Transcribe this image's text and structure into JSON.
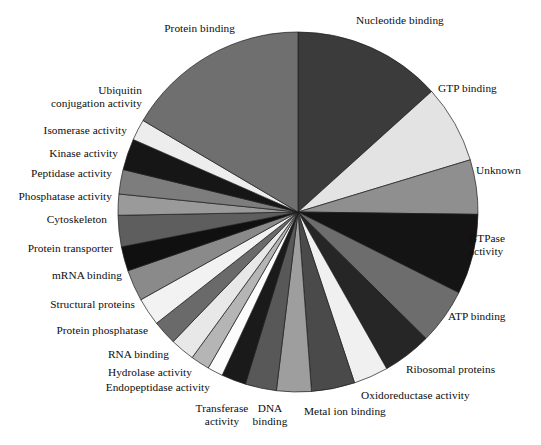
{
  "chart_data": {
    "type": "pie",
    "title": "",
    "subtitle": "",
    "xlabel": "",
    "ylabel": "",
    "legend_position": "none",
    "grid": false,
    "label_style": "outside-leader-free",
    "start_angle_deg": 0,
    "direction": "clockwise",
    "units": "percent of annotated proteins",
    "center": {
      "x": 298,
      "y": 212
    },
    "radius": 180,
    "categories": [
      "Nucleotide binding",
      "GTP binding",
      "Unknown",
      "GTPase activity",
      "ATP binding",
      "Ribosomal proteins",
      "Oxidoreductase activity",
      "Metal ion binding",
      "DNA binding",
      "Transferase activity",
      "Endopeptidase activity",
      "Hydrolase activity",
      "RNA binding",
      "Protein phosphatase",
      "Structural proteins",
      "mRNA binding",
      "Protein transporter",
      "Cytoskeleton",
      "Phosphatase activity",
      "Peptidase activity",
      "Kinase activity",
      "Isomerase activity",
      "Ubiquitin conjugation activity",
      "Protein binding"
    ],
    "values": [
      13.3,
      7.0,
      4.9,
      7.2,
      5.0,
      4.4,
      3.1,
      3.9,
      3.1,
      2.8,
      2.2,
      1.4,
      1.7,
      2.2,
      2.2,
      2.5,
      2.8,
      2.2,
      2.8,
      1.9,
      2.2,
      2.8,
      1.9,
      16.5
    ],
    "angles_deg": [
      47.9,
      25.2,
      17.6,
      25.9,
      18.0,
      15.8,
      11.2,
      14.0,
      11.2,
      10.1,
      7.9,
      5.0,
      6.1,
      7.9,
      7.9,
      9.0,
      10.1,
      7.9,
      10.1,
      6.8,
      7.9,
      10.1,
      6.8,
      59.4
    ],
    "colors": [
      "#3b3b3b",
      "#e3e3e3",
      "#8f8f8f",
      "#141414",
      "#6d6d6d",
      "#262626",
      "#f0f0f0",
      "#4a4a4a",
      "#9e9e9e",
      "#585858",
      "#1a1a1a",
      "#fcfcfc",
      "#b5b5b5",
      "#e8e8e8",
      "#6a6a6a",
      "#f2f2f2",
      "#8a8a8a",
      "#101010",
      "#5e5e5e",
      "#9a9a9a",
      "#7d7d7d",
      "#161616",
      "#ededed",
      "#6f6f6f"
    ]
  },
  "labels": [
    {
      "name": "label-nucleotide-binding",
      "text": "Nucleotide binding",
      "x": 356,
      "y": 14,
      "align": "left"
    },
    {
      "name": "label-gtp-binding",
      "text": "GTP binding",
      "x": 438,
      "y": 82,
      "align": "left"
    },
    {
      "name": "label-unknown",
      "text": "Unknown",
      "x": 476,
      "y": 164,
      "align": "left"
    },
    {
      "name": "label-gtpase-activity",
      "text": "GTPase\nactivity",
      "x": 469,
      "y": 232,
      "align": "left"
    },
    {
      "name": "label-atp-binding",
      "text": "ATP binding",
      "x": 448,
      "y": 310,
      "align": "left"
    },
    {
      "name": "label-ribosomal-proteins",
      "text": "Ribosomal proteins",
      "x": 406,
      "y": 363,
      "align": "left"
    },
    {
      "name": "label-oxidoreductase",
      "text": "Oxidoreductase activity",
      "x": 361,
      "y": 389,
      "align": "left"
    },
    {
      "name": "label-metal-ion-binding",
      "text": "Metal ion binding",
      "x": 304,
      "y": 405,
      "align": "left"
    },
    {
      "name": "label-dna-binding",
      "text": "DNA\nbinding",
      "x": 270,
      "y": 402,
      "align": "center"
    },
    {
      "name": "label-transferase",
      "text": "Transferase\nactivity",
      "x": 222,
      "y": 402,
      "align": "center"
    },
    {
      "name": "label-endopeptidase",
      "text": "Endopeptidase activity",
      "x": 210,
      "y": 381,
      "align": "right"
    },
    {
      "name": "label-hydrolase-activity",
      "text": "Hydrolase activity",
      "x": 192,
      "y": 366,
      "align": "right"
    },
    {
      "name": "label-rna-binding",
      "text": "RNA binding",
      "x": 169,
      "y": 348,
      "align": "right"
    },
    {
      "name": "label-protein-phosphatase",
      "text": "Protein phosphatase",
      "x": 148,
      "y": 324,
      "align": "right"
    },
    {
      "name": "label-structural-proteins",
      "text": "Structural proteins",
      "x": 135,
      "y": 298,
      "align": "right"
    },
    {
      "name": "label-mrna-binding",
      "text": "mRNA binding",
      "x": 122,
      "y": 269,
      "align": "right"
    },
    {
      "name": "label-protein-transporter",
      "text": "Protein transporter",
      "x": 113,
      "y": 242,
      "align": "right"
    },
    {
      "name": "label-cytoskeleton",
      "text": "Cytoskeleton",
      "x": 107,
      "y": 213,
      "align": "right"
    },
    {
      "name": "label-phosphatase",
      "text": "Phosphatase activity",
      "x": 112,
      "y": 190,
      "align": "right"
    },
    {
      "name": "label-peptidase",
      "text": "Peptidase activity",
      "x": 112,
      "y": 167,
      "align": "right"
    },
    {
      "name": "label-kinase-activity",
      "text": "Kinase activity",
      "x": 118,
      "y": 147,
      "align": "right"
    },
    {
      "name": "label-isomerase-activity",
      "text": "Isomerase activity",
      "x": 127,
      "y": 124,
      "align": "right"
    },
    {
      "name": "label-ubiquitin",
      "text": "Ubiquitin\nconjugation activity",
      "x": 142,
      "y": 84,
      "align": "right"
    },
    {
      "name": "label-protein-binding",
      "text": "Protein binding",
      "x": 235,
      "y": 22,
      "align": "right"
    }
  ]
}
